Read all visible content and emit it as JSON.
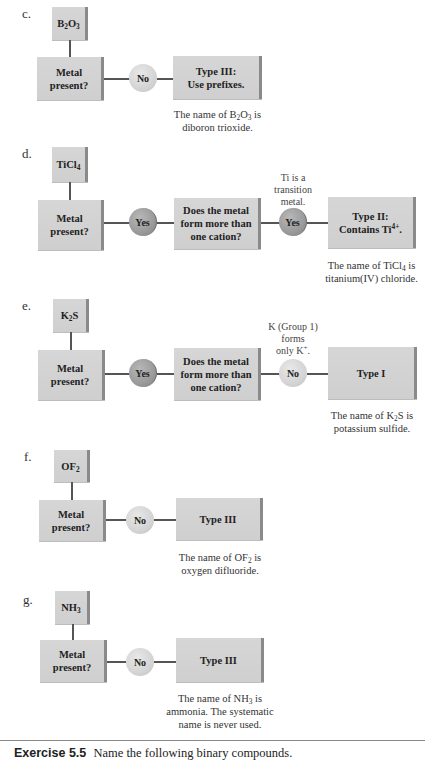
{
  "parts": {
    "c": {
      "label": "c.",
      "formula_base": "B",
      "formula_sub1": "2",
      "formula_mid": "O",
      "formula_sub2": "3",
      "metal_question": [
        "Metal",
        "present?"
      ],
      "answer1": "No",
      "result": [
        "Type III:",
        "Use prefixes."
      ],
      "caption_pre": "The name of B",
      "caption_sub1": "2",
      "caption_mid": "O",
      "caption_sub2": "3",
      "caption_post": " is",
      "caption_line2": "diboron trioxide."
    },
    "d": {
      "label": "d.",
      "formula_base": "TiCl",
      "formula_sub": "4",
      "metal_question": [
        "Metal",
        "present?"
      ],
      "answer1": "Yes",
      "question2": [
        "Does the metal",
        "form more than",
        "one cation?"
      ],
      "annotation": [
        "Ti is a",
        "transition",
        "metal."
      ],
      "answer2": "Yes",
      "result_line1": "Type II:",
      "result_line2_pre": "Contains Ti",
      "result_sup": "4+",
      "result_line2_post": ".",
      "caption_pre": "The name of TiCl",
      "caption_sub": "4",
      "caption_post": " is",
      "caption_line2": "titanium(IV) chloride."
    },
    "e": {
      "label": "e.",
      "formula_base": "K",
      "formula_sub": "2",
      "formula_post": "S",
      "metal_question": [
        "Metal",
        "present?"
      ],
      "answer1": "Yes",
      "question2": [
        "Does the metal",
        "form more than",
        "one cation?"
      ],
      "annotation_line1": "K (Group 1)",
      "annotation_line2": "forms",
      "annotation_line3_pre": "only K",
      "annotation_sup": "+",
      "annotation_line3_post": ".",
      "answer2": "No",
      "result": "Type I",
      "caption_pre": "The name of K",
      "caption_sub": "2",
      "caption_post": "S is",
      "caption_line2": "potassium sulfide."
    },
    "f": {
      "label": "f.",
      "formula_base": "OF",
      "formula_sub": "2",
      "metal_question": [
        "Metal",
        "present?"
      ],
      "answer1": "No",
      "result": "Type III",
      "caption_pre": "The name of OF",
      "caption_sub": "2",
      "caption_post": " is",
      "caption_line2": "oxygen difluoride."
    },
    "g": {
      "label": "g.",
      "formula_base": "NH",
      "formula_sub": "3",
      "metal_question": [
        "Metal",
        "present?"
      ],
      "answer1": "No",
      "result": "Type III",
      "caption_pre": "The name of NH",
      "caption_sub": "3",
      "caption_post": " is",
      "caption_line2": "ammonia. The systematic",
      "caption_line3": "name is never used."
    }
  },
  "exercise": {
    "label": "Exercise 5.5",
    "text": "Name the following binary compounds."
  },
  "colors": {
    "box_fill": "#d3d3d3",
    "box_edge": "#8a8a8a",
    "yes_circle": "#9a9a9a",
    "no_circle": "#d8d8d8",
    "connector": "#555555"
  }
}
